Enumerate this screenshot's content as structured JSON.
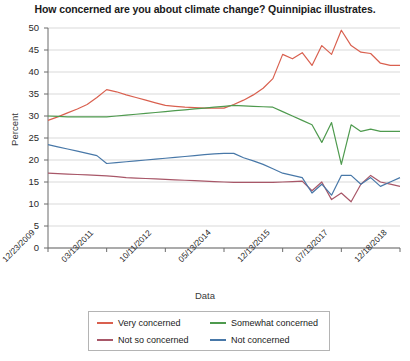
{
  "chart_data": {
    "type": "line",
    "title": "How concerned are you about climate change? Quinnipiac illustrates.",
    "xlabel": "Data",
    "ylabel": "Percent",
    "ylim": [
      0,
      50
    ],
    "ytick_step": 5,
    "yticks": [
      "50",
      "45",
      "40",
      "35",
      "30",
      "25",
      "20",
      "15",
      "10",
      "5",
      "0"
    ],
    "grid": true,
    "legend_position": "bottom",
    "xtick_labels": [
      "12/23/2009",
      "03/13/2011",
      "10/11/2012",
      "05/13/2014",
      "12/13/2015",
      "07/13/2017",
      "12/18/2018"
    ],
    "xtick_index": [
      0,
      6,
      12,
      18,
      24,
      30,
      36
    ],
    "x_count": 37,
    "series": [
      {
        "name": "Very concerned",
        "color": "#d9604f",
        "values": [
          29.0,
          29.8,
          30.7,
          31.6,
          32.6,
          34.2,
          36.0,
          35.5,
          34.8,
          34.2,
          33.6,
          33.0,
          32.4,
          32.2,
          32.0,
          31.9,
          31.8,
          31.8,
          31.8,
          32.6,
          33.6,
          34.8,
          36.3,
          38.5,
          44.0,
          43.0,
          44.4,
          41.5,
          46.0,
          44.0,
          49.5,
          46.0,
          44.5,
          44.2,
          42.0,
          41.5,
          41.5
        ]
      },
      {
        "name": "Somewhat concerned",
        "color": "#4e9a4e",
        "values": [
          30.0,
          29.9,
          29.8,
          29.8,
          29.8,
          29.8,
          29.8,
          30.0,
          30.2,
          30.4,
          30.6,
          30.8,
          31.0,
          31.2,
          31.4,
          31.6,
          31.8,
          32.0,
          32.2,
          32.4,
          32.3,
          32.2,
          32.1,
          32.0,
          31.0,
          30.0,
          29.0,
          28.0,
          24.0,
          28.5,
          19.0,
          28.0,
          26.5,
          27.0,
          26.5,
          26.5,
          26.5
        ]
      },
      {
        "name": "Not so concerned",
        "color": "#a85768",
        "values": [
          17.0,
          16.9,
          16.8,
          16.7,
          16.6,
          16.5,
          16.4,
          16.2,
          16.0,
          15.9,
          15.8,
          15.7,
          15.6,
          15.5,
          15.4,
          15.3,
          15.2,
          15.1,
          15.0,
          14.9,
          14.9,
          14.9,
          14.9,
          14.9,
          15.0,
          15.1,
          15.2,
          13.0,
          15.0,
          11.0,
          12.5,
          10.5,
          14.5,
          16.5,
          15.0,
          14.5,
          14.0
        ]
      },
      {
        "name": "Not concerned",
        "color": "#4878a8",
        "values": [
          23.5,
          23.0,
          22.5,
          22.0,
          21.5,
          21.0,
          19.2,
          19.4,
          19.6,
          19.8,
          20.0,
          20.2,
          20.4,
          20.6,
          20.8,
          21.0,
          21.2,
          21.4,
          21.5,
          21.5,
          20.5,
          19.8,
          19.0,
          18.0,
          17.0,
          16.5,
          16.0,
          12.5,
          14.5,
          12.0,
          16.5,
          16.5,
          14.5,
          16.0,
          14.0,
          15.0,
          16.0
        ]
      }
    ]
  },
  "legend": {
    "items": [
      {
        "label": "Very concerned"
      },
      {
        "label": "Somewhat concerned"
      },
      {
        "label": "Not so concerned"
      },
      {
        "label": "Not concerned"
      }
    ]
  }
}
